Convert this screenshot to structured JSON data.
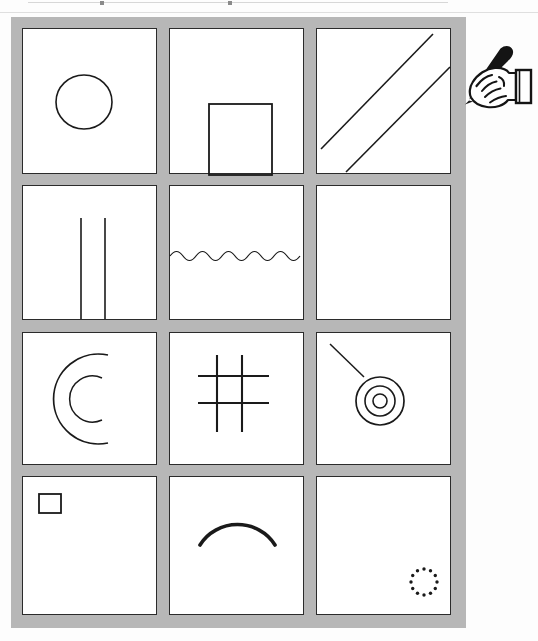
{
  "document": {
    "type": "scanned-worksheet",
    "title": "Shape drawing grid worksheet",
    "background_color": "#fdfdfd",
    "frame_color": "#b7b7b7",
    "ink_color": "#1a1a1a",
    "cell_background": "#ffffff",
    "rows": 4,
    "columns": 3,
    "total_cells": 12
  },
  "scan_artifacts": {
    "top_edge_line_label": "page-edge-line",
    "visible": true
  },
  "annotation": {
    "hand_icon_label": "hand-holding-pen",
    "position": "top-right, outside grid, pointing at cell 3",
    "pen_color": "#141414",
    "hand_outline_color": "#141414"
  },
  "grid": {
    "cells": [
      {
        "index": 1,
        "row": 1,
        "column": 1,
        "shape": "circle",
        "shape_label": "Circle",
        "icon_name": "circle-shape",
        "description": "Hand-drawn open circle centred slightly left of cell centre"
      },
      {
        "index": 2,
        "row": 1,
        "column": 2,
        "shape": "square",
        "shape_label": "Square",
        "icon_name": "square-shape",
        "description": "Square drawn at the bottom of the cell, overlapping the lower border"
      },
      {
        "index": 3,
        "row": 1,
        "column": 3,
        "shape": "diagonal-lines",
        "shape_label": "Two diagonal lines",
        "icon_name": "diagonal-lines-shape",
        "description": "Two parallel diagonal lines rising to the right; pen is drawing the second one"
      },
      {
        "index": 4,
        "row": 2,
        "column": 1,
        "shape": "vertical-lines",
        "shape_label": "Two vertical lines",
        "icon_name": "vertical-lines-shape",
        "description": "Two short parallel vertical lines near the cell centre"
      },
      {
        "index": 5,
        "row": 2,
        "column": 2,
        "shape": "wavy-line",
        "shape_label": "Wavy line",
        "icon_name": "wavy-line-shape",
        "description": "Horizontal sinusoidal wave spanning the full cell width"
      },
      {
        "index": 6,
        "row": 2,
        "column": 3,
        "shape": "empty",
        "shape_label": "Empty",
        "icon_name": "empty-cell",
        "description": "Blank cell, no drawing"
      },
      {
        "index": 7,
        "row": 3,
        "column": 1,
        "shape": "concentric-arcs",
        "shape_label": "Two C arcs",
        "icon_name": "concentric-c-arcs-shape",
        "description": "Two nested C-shaped arcs opening to the right"
      },
      {
        "index": 8,
        "row": 3,
        "column": 2,
        "shape": "hash-grid",
        "shape_label": "Hash / tic-tac-toe grid",
        "icon_name": "hash-grid-shape",
        "description": "Two vertical and two horizontal crossing lines forming a hash"
      },
      {
        "index": 9,
        "row": 3,
        "column": 3,
        "shape": "bullseye-with-pointer",
        "shape_label": "Concentric circles with line",
        "icon_name": "bullseye-shape",
        "description": "Three concentric circles with a diagonal line leading in from upper left"
      },
      {
        "index": 10,
        "row": 4,
        "column": 1,
        "shape": "small-square",
        "shape_label": "Small square",
        "icon_name": "small-square-shape",
        "description": "Small square in the upper-left corner of the cell"
      },
      {
        "index": 11,
        "row": 4,
        "column": 2,
        "shape": "arch",
        "shape_label": "Arch",
        "icon_name": "arch-shape",
        "description": "Thick dome / arch curve opening downwards"
      },
      {
        "index": 12,
        "row": 4,
        "column": 3,
        "shape": "dotted-circle",
        "shape_label": "Dotted circle",
        "icon_name": "dotted-circle-shape",
        "description": "Ring of twelve small dots in the lower-right corner"
      }
    ]
  }
}
